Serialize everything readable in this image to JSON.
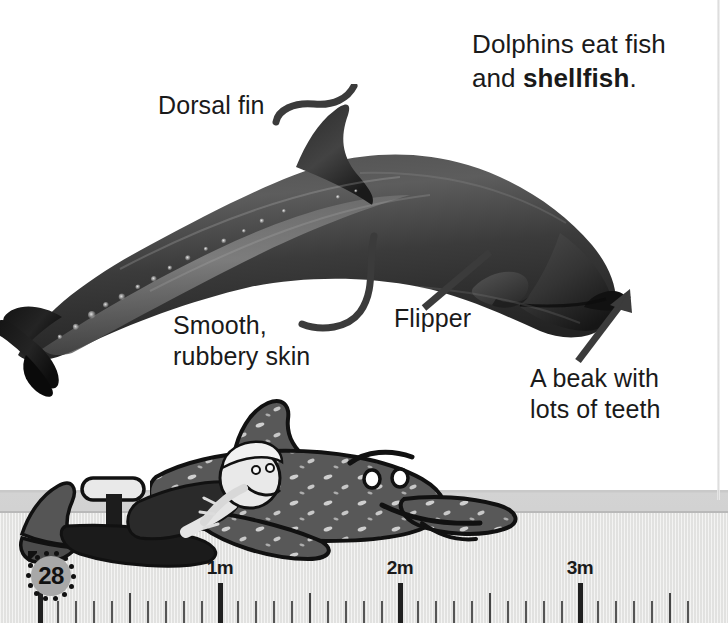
{
  "page": {
    "number": "28",
    "background_color": "#ffffff",
    "ground_color": "#cfcfcf",
    "ruler_band_color": "#e6e6e4",
    "ink_color": "#1a1a1a"
  },
  "fact_box": {
    "line1": "Dolphins eat fish",
    "line2_prefix": "and ",
    "line2_bold": "shellfish",
    "line2_suffix": "."
  },
  "annotations": [
    {
      "id": "dorsal-fin",
      "label": "Dorsal fin",
      "pointer": "curved-hook"
    },
    {
      "id": "smooth-skin",
      "label": "Smooth,\nrubbery skin",
      "pointer": "curved-hook"
    },
    {
      "id": "flipper",
      "label": "Flipper",
      "pointer": "straight-line"
    },
    {
      "id": "beak",
      "label": "A beak with\nlots of teeth",
      "pointer": "arrow"
    }
  ],
  "ruler": {
    "unit": "m",
    "origin_px": 40,
    "pixels_per_meter": 180,
    "minor_tick_spacing_m": 0.1,
    "labels": [
      {
        "value": "1m",
        "meters": 1
      },
      {
        "value": "2m",
        "meters": 2
      },
      {
        "value": "3m",
        "meters": 3
      }
    ]
  },
  "illustrations": {
    "photo_subject": "bottlenose-dolphin-photograph",
    "cartoon_diver": "cartoon-diver-lying-down",
    "cartoon_dolphin": "cartoon-dolphin-smiling"
  }
}
